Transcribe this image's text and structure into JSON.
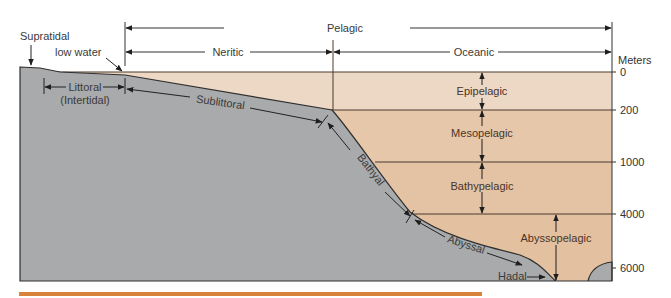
{
  "horizontal_zones": {
    "pelagic": "Pelagic",
    "neritic": "Neritic",
    "oceanic": "Oceanic"
  },
  "shore_labels": {
    "supratidal": "Supratidal",
    "low_water": "low water",
    "littoral": "Littoral",
    "intertidal": "(Intertidal)"
  },
  "benthic_zones": {
    "sublittoral": "Sublittoral",
    "bathyal": "Bathyal",
    "abyssal": "Abyssal",
    "hadal": "Hadal"
  },
  "pelagic_depth_zones": [
    {
      "label": "Epipelagic",
      "from": 0,
      "to": 200
    },
    {
      "label": "Mesopelagic",
      "from": 200,
      "to": 1000
    },
    {
      "label": "Bathypelagic",
      "from": 1000,
      "to": 4000
    },
    {
      "label": "Abyssopelagic",
      "from": 4000,
      "to": 6000
    }
  ],
  "depth_axis": {
    "unit": "Meters",
    "ticks": [
      "0",
      "200",
      "1000",
      "4000",
      "6000"
    ]
  },
  "colors": {
    "seafloor": "#a9aaac",
    "water_epipelagic": "#ecd7c2",
    "water_deep": "#e2c0a0",
    "lines": "#3b2f2a",
    "accent_bar": "#d9823a"
  }
}
